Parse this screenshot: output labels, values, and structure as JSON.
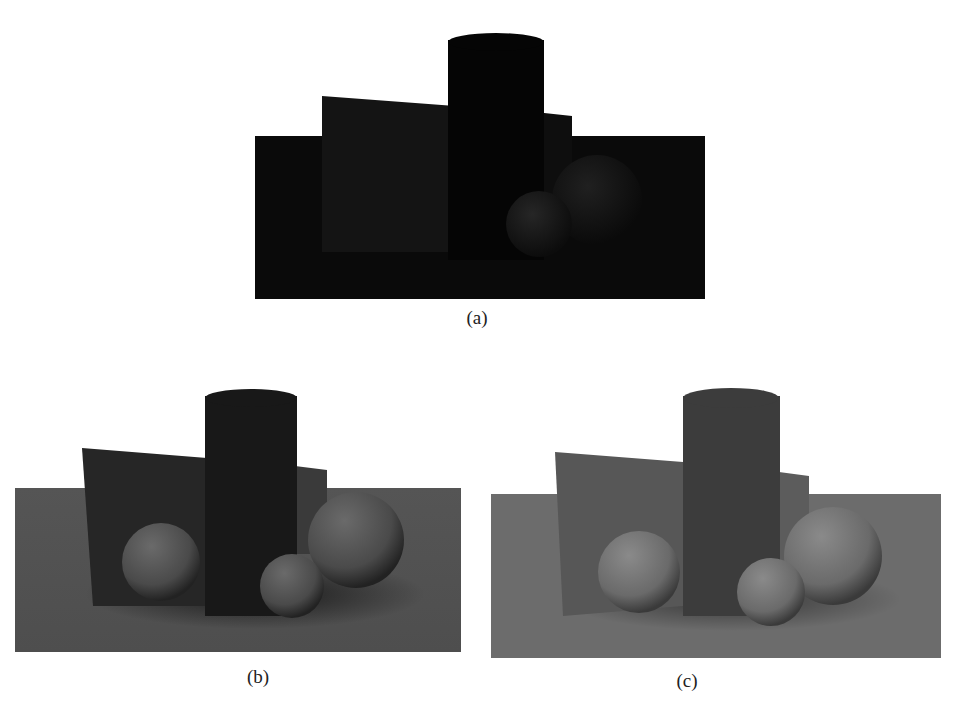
{
  "figure": {
    "subfigures": [
      {
        "id": "a",
        "caption": "(a)",
        "description": "Rendered scene: floor plane, tilted wall panel, cylinder, two spheres — very dark (underexposed)",
        "colors": {
          "floor": "#0a0a0a",
          "panel": "#141414",
          "panel_right": "#0e0e0e",
          "cylinder": "#050505",
          "sphere_back": "#121212",
          "sphere_front": "#1c1c1c"
        }
      },
      {
        "id": "b",
        "caption": "(b)",
        "description": "Rendered scene: floor plane, tilted wall panel, cylinder, three spheres — medium-dark with soft shadows",
        "colors": {
          "floor": "#555555",
          "panel": "#262626",
          "panel_right": "#3a3a3a",
          "cylinder": "#181818",
          "sphere": "#5a5a5a"
        }
      },
      {
        "id": "c",
        "caption": "(c)",
        "description": "Rendered scene: floor plane, tilted wall panel, cylinder, three spheres — brighter with soft shadows",
        "colors": {
          "floor": "#6c6c6c",
          "panel": "#575757",
          "panel_right": "#5c5c5c",
          "cylinder": "#3c3c3c",
          "sphere": "#7a7a7a"
        }
      }
    ]
  }
}
